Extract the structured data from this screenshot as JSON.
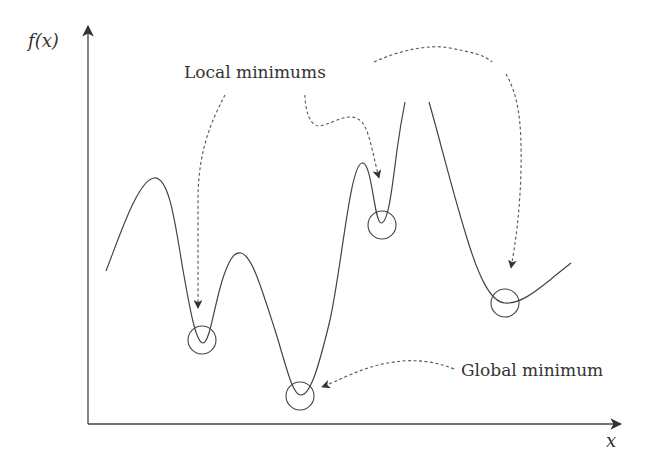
{
  "diagram": {
    "colors": {
      "stroke": "#444444",
      "text": "#333333",
      "background": "#ffffff"
    },
    "axes": {
      "y_label": "f(x)",
      "x_label": "x"
    },
    "labels": {
      "local": "Local minimums",
      "global": "Global minimum"
    },
    "minima": [
      {
        "id": "local-1",
        "kind": "local",
        "cx": 202,
        "cy": 340
      },
      {
        "id": "global",
        "kind": "global",
        "cx": 300,
        "cy": 396
      },
      {
        "id": "local-2",
        "kind": "local",
        "cx": 382,
        "cy": 225
      },
      {
        "id": "local-3",
        "kind": "local",
        "cx": 505,
        "cy": 303
      }
    ]
  }
}
